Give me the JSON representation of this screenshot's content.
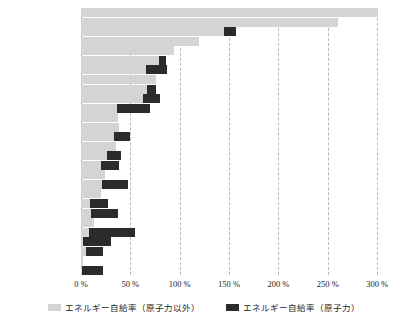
{
  "chart_data": {
    "type": "bar",
    "orientation": "horizontal",
    "stacked": true,
    "title": "",
    "xlabel": "",
    "ylabel": "",
    "xlim": [
      0,
      310
    ],
    "xticks": [
      "0 %",
      "50 %",
      "100 %",
      "150 %",
      "200 %",
      "250 %",
      "300 %"
    ],
    "xtick_values": [
      0,
      50,
      100,
      150,
      200,
      250,
      300
    ],
    "grid": "vertical-dashed",
    "legend_position": "bottom-center",
    "series": [
      {
        "name": "エネルギー自給率（原子力以外）",
        "color": "#d4d4d4",
        "values": [
          301,
          260,
          145,
          120,
          94,
          79,
          66,
          76,
          67,
          63,
          36,
          37,
          38,
          33,
          35,
          26,
          20,
          24,
          21,
          20,
          9,
          10,
          13,
          8,
          2,
          5,
          2,
          1
        ]
      },
      {
        "name": "エネルギー自給率（原子力）",
        "color": "#2b2b2b",
        "values": [
          0,
          0,
          12,
          0,
          0,
          7,
          21,
          0,
          9,
          17,
          34,
          0,
          0,
          17,
          0,
          15,
          18,
          0,
          27,
          0,
          18,
          28,
          0,
          47,
          28,
          17,
          0,
          21
        ]
      }
    ],
    "categories": [
      "ノルウェー",
      "オーストラリア",
      "カナダ",
      "デンマーク",
      "ニュージーランド",
      "オランダ",
      "アメリカ",
      "ポーランド",
      "イギリス",
      "チュコ",
      "スウェーデン",
      "ギリシャ",
      "オーストリア",
      "フィンランド",
      "トルコ",
      "ドイツ",
      "ハンガリー",
      "ポルトガル",
      "スイス",
      "イタリア",
      "スペイン",
      "スロバキア",
      "アイルランド",
      "フランス",
      "スペイン",
      "日本",
      "ルクセンブルク",
      "韓国"
    ]
  },
  "legend": {
    "items": [
      {
        "label": "エネルギー自給率（原子力以外）",
        "icon": "legend-swatch-gray"
      },
      {
        "label": "エネルギー自給率（原子力）",
        "icon": "legend-swatch-black"
      }
    ]
  }
}
